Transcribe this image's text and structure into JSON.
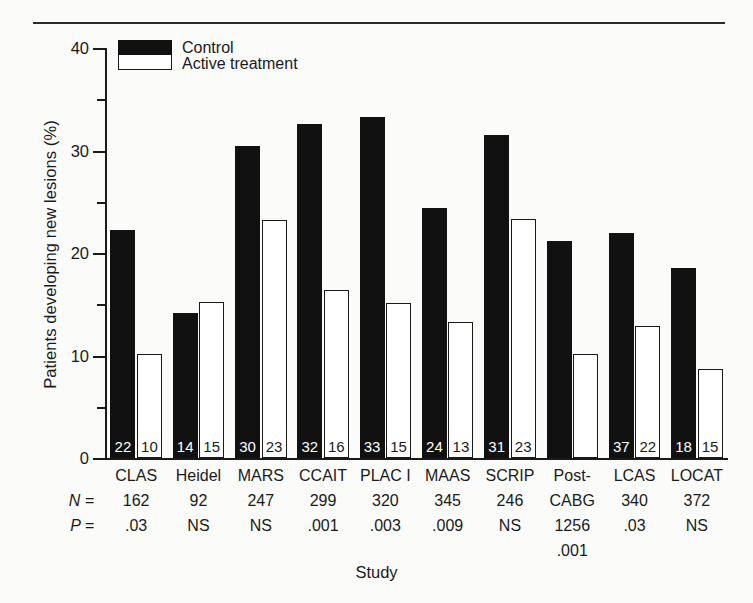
{
  "figure": {
    "xlabel": "Study",
    "ylabel": "Patients developing new lesions (%)",
    "row_head_n": "N =",
    "row_head_p": "P ="
  },
  "legend": {
    "items": [
      {
        "label": "Control",
        "swatch": "black-filled-swatch",
        "color": "#111111"
      },
      {
        "label": "Active treatment",
        "swatch": "white-open-swatch",
        "color": "#ffffff"
      }
    ]
  },
  "yaxis": {
    "major_ticks": [
      "40",
      "30",
      "20",
      "10",
      "0"
    ],
    "minor_ticks": [
      "35",
      "25",
      "15",
      "5"
    ],
    "min": 0,
    "max": 40
  },
  "chart_data": {
    "type": "bar",
    "title": "",
    "xlabel": "Study",
    "ylabel": "Patients developing new lesions (%)",
    "ylim": [
      0,
      40
    ],
    "yticks": [
      0,
      10,
      20,
      30,
      40
    ],
    "yticks_minor": [
      5,
      15,
      25,
      35
    ],
    "grid": false,
    "legend_position": "top-left",
    "categories": [
      "CLAS",
      "Heidel",
      "MARS",
      "CCAIT",
      "PLAC I",
      "MAAS",
      "SCRIP",
      "Post-CABG",
      "LCAS",
      "LOCAT"
    ],
    "category_lines": [
      [
        "CLAS"
      ],
      [
        "Heidel"
      ],
      [
        "MARS"
      ],
      [
        "CCAIT"
      ],
      [
        "PLAC I"
      ],
      [
        "MAAS"
      ],
      [
        "SCRIP"
      ],
      [
        "Post-",
        "CABG"
      ],
      [
        "LCAS"
      ],
      [
        "LOCAT"
      ]
    ],
    "series": [
      {
        "name": "Control",
        "color": "#111111",
        "values": [
          22.2,
          14.1,
          30.4,
          32.6,
          33.3,
          24.4,
          31.5,
          21.2,
          22.0,
          18.5
        ],
        "labels": [
          "22",
          "14",
          "30",
          "32",
          "33",
          "24",
          "31",
          "",
          "37",
          "18"
        ]
      },
      {
        "name": "Active treatment",
        "color": "#ffffff",
        "values": [
          10.1,
          15.2,
          23.2,
          16.4,
          15.1,
          13.3,
          23.3,
          10.1,
          12.9,
          8.7
        ],
        "labels": [
          "10",
          "15",
          "23",
          "16",
          "15",
          "13",
          "23",
          "",
          "22",
          "15"
        ]
      }
    ],
    "annotations": {
      "N": [
        "162",
        "92",
        "247",
        "299",
        "320",
        "345",
        "246",
        "1256",
        "340",
        "372"
      ],
      "P": [
        ".03",
        "NS",
        "NS",
        ".001",
        ".003",
        ".009",
        "NS",
        ".001",
        ".03",
        "NS"
      ]
    }
  }
}
